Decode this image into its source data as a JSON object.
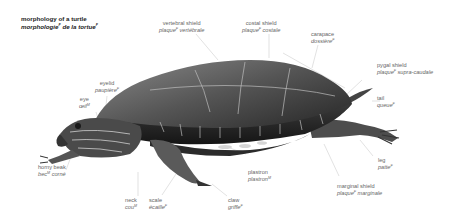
{
  "title": {
    "en": "morphology of a turtle",
    "fr_main": "morphologie",
    "fr_main_gender": "F",
    "fr_rest": " de la tortue",
    "fr_rest_gender": "F"
  },
  "labels": [
    {
      "id": "vertebral-shield",
      "en": "vertebral shield",
      "fr": "plaque",
      "gender": "F",
      "fr2": " vertébrale"
    },
    {
      "id": "costal-shield",
      "en": "costal shield",
      "fr": "plaque",
      "gender": "F",
      "fr2": " costale"
    },
    {
      "id": "carapace",
      "en": "carapace",
      "fr": "dossière",
      "gender": "F",
      "fr2": ""
    },
    {
      "id": "pygal-shield",
      "en": "pygal shield",
      "fr": "plaque",
      "gender": "F",
      "fr2": " supra-caudale"
    },
    {
      "id": "tail",
      "en": "tail",
      "fr": "queue",
      "gender": "F",
      "fr2": ""
    },
    {
      "id": "eyelid",
      "en": "eyelid",
      "fr": "paupière",
      "gender": "F",
      "fr2": ""
    },
    {
      "id": "eye",
      "en": "eye",
      "fr": "œil",
      "gender": "M",
      "fr2": ""
    },
    {
      "id": "horny-beak",
      "en": "horny beak",
      "fr": "bec",
      "gender": "M",
      "fr2": " corné"
    },
    {
      "id": "neck",
      "en": "neck",
      "fr": "cou",
      "gender": "M",
      "fr2": ""
    },
    {
      "id": "scale",
      "en": "scale",
      "fr": "écaille",
      "gender": "F",
      "fr2": ""
    },
    {
      "id": "claw",
      "en": "claw",
      "fr": "griffe",
      "gender": "F",
      "fr2": ""
    },
    {
      "id": "plastron",
      "en": "plastron",
      "fr": "plastron",
      "gender": "M",
      "fr2": ""
    },
    {
      "id": "leg",
      "en": "leg",
      "fr": "patte",
      "gender": "F",
      "fr2": ""
    },
    {
      "id": "marginal-shield",
      "en": "marginal shield",
      "fr": "plaque",
      "gender": "F",
      "fr2": " marginale"
    }
  ],
  "colors": {
    "label_text": "#666666",
    "title_text": "#222222",
    "leader_line": "#cfcfcf",
    "shell_dark": "#2a2a2a",
    "shell_mid": "#6a6a6a",
    "skin": "#4a4a4a"
  }
}
